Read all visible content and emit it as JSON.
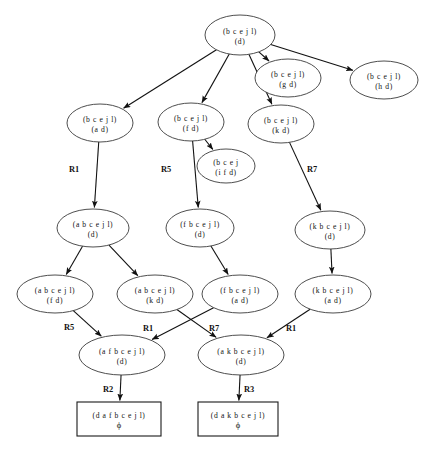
{
  "diagram": {
    "background_color": "#ffffff",
    "node_stroke_color": "#3a3a3a",
    "edge_color": "#111111",
    "box_stroke_color": "#1a1a1a",
    "nodes": [
      {
        "id": "n_root",
        "line1": "(b c e j l)",
        "line2": "(d)",
        "shape": "ellipse",
        "cx": 240,
        "cy": 35,
        "rx": 35,
        "ry": 20
      },
      {
        "id": "n_gd",
        "line1": "(b c e j l)",
        "line2": "(g d)",
        "shape": "ellipse",
        "cx": 288,
        "cy": 78,
        "rx": 33,
        "ry": 19
      },
      {
        "id": "n_hd",
        "line1": "(b c e j l)",
        "line2": "(h d)",
        "shape": "ellipse",
        "cx": 384,
        "cy": 80,
        "rx": 34,
        "ry": 19
      },
      {
        "id": "n_ad",
        "line1": "(b c e j l)",
        "line2": "(a d)",
        "shape": "ellipse",
        "cx": 100,
        "cy": 123,
        "rx": 33,
        "ry": 19
      },
      {
        "id": "n_fd",
        "line1": "(b c e j l)",
        "line2": "(f d)",
        "shape": "ellipse",
        "cx": 191,
        "cy": 122,
        "rx": 33,
        "ry": 19
      },
      {
        "id": "n_kd",
        "line1": "(b c e j l)",
        "line2": "(k d)",
        "shape": "ellipse",
        "cx": 281,
        "cy": 124,
        "rx": 33,
        "ry": 19
      },
      {
        "id": "n_ifd",
        "line1": "(b c e j",
        "line2": "(i f d)",
        "shape": "ellipse",
        "cx": 226,
        "cy": 166,
        "rx": 29,
        "ry": 17
      },
      {
        "id": "n_abcejl",
        "line1": "(a b c e j l)",
        "line2": "(d)",
        "shape": "ellipse",
        "cx": 93,
        "cy": 228,
        "rx": 36,
        "ry": 19
      },
      {
        "id": "n_fbcejl",
        "line1": "(f b c e j l)",
        "line2": "(d)",
        "shape": "ellipse",
        "cx": 200,
        "cy": 228,
        "rx": 34,
        "ry": 19
      },
      {
        "id": "n_kbcejl",
        "line1": "(k b c e j l)",
        "line2": "(d)",
        "shape": "ellipse",
        "cx": 330,
        "cy": 230,
        "rx": 35,
        "ry": 19
      },
      {
        "id": "n_abc_fd",
        "line1": "(a b c e j l)",
        "line2": "(f d)",
        "shape": "ellipse",
        "cx": 55,
        "cy": 294,
        "rx": 38,
        "ry": 19
      },
      {
        "id": "n_abc_kd",
        "line1": "(a b c e j l)",
        "line2": "(k d)",
        "shape": "ellipse",
        "cx": 155,
        "cy": 294,
        "rx": 38,
        "ry": 19
      },
      {
        "id": "n_fbc_ad",
        "line1": "(f b c e j l)",
        "line2": "(a d)",
        "shape": "ellipse",
        "cx": 240,
        "cy": 294,
        "rx": 38,
        "ry": 19
      },
      {
        "id": "n_kbc_ad",
        "line1": "(k b c e j l)",
        "line2": "(a d)",
        "shape": "ellipse",
        "cx": 333,
        "cy": 294,
        "rx": 38,
        "ry": 19
      },
      {
        "id": "n_afb",
        "line1": "(a f b c e j l)",
        "line2": "(d)",
        "shape": "ellipse",
        "cx": 122,
        "cy": 355,
        "rx": 43,
        "ry": 20
      },
      {
        "id": "n_akb",
        "line1": "(a k b c e j l)",
        "line2": "(d)",
        "shape": "ellipse",
        "cx": 241,
        "cy": 355,
        "rx": 43,
        "ry": 20
      },
      {
        "id": "n_box_l",
        "line1": "(d a f b c e j l)",
        "line2": "ϕ",
        "shape": "box",
        "cx": 119,
        "cy": 419,
        "rx": 42,
        "ry": 17
      },
      {
        "id": "n_box_r",
        "line1": "(d a k b c e j l)",
        "line2": "ϕ",
        "shape": "box",
        "cx": 238,
        "cy": 419,
        "rx": 40,
        "ry": 17
      }
    ],
    "edges": [
      {
        "from": "n_root",
        "to": "n_ad",
        "label": ""
      },
      {
        "from": "n_root",
        "to": "n_fd",
        "label": ""
      },
      {
        "from": "n_root",
        "to": "n_kd",
        "label": ""
      },
      {
        "from": "n_root",
        "to": "n_gd",
        "label": ""
      },
      {
        "from": "n_root",
        "to": "n_hd",
        "label": ""
      },
      {
        "from": "n_fd",
        "to": "n_ifd",
        "label": ""
      },
      {
        "from": "n_ad",
        "to": "n_abcejl",
        "label": "R1"
      },
      {
        "from": "n_fd",
        "to": "n_fbcejl",
        "label": "R5"
      },
      {
        "from": "n_kd",
        "to": "n_kbcejl",
        "label": "R7"
      },
      {
        "from": "n_abcejl",
        "to": "n_abc_fd",
        "label": ""
      },
      {
        "from": "n_abcejl",
        "to": "n_abc_kd",
        "label": ""
      },
      {
        "from": "n_fbcejl",
        "to": "n_fbc_ad",
        "label": ""
      },
      {
        "from": "n_kbcejl",
        "to": "n_kbc_ad",
        "label": ""
      },
      {
        "from": "n_abc_fd",
        "to": "n_afb",
        "label": "R5"
      },
      {
        "from": "n_abc_kd",
        "to": "n_akb",
        "label": "R1"
      },
      {
        "from": "n_fbc_ad",
        "to": "n_afb",
        "label": "R7"
      },
      {
        "from": "n_kbc_ad",
        "to": "n_akb",
        "label": "R1"
      },
      {
        "from": "n_afb",
        "to": "n_box_l",
        "label": "R2"
      },
      {
        "from": "n_akb",
        "to": "n_box_r",
        "label": "R3"
      }
    ],
    "edge_labels": [
      {
        "text": "R1",
        "x": 74,
        "y": 172
      },
      {
        "text": "R5",
        "x": 166,
        "y": 172
      },
      {
        "text": "R7",
        "x": 312,
        "y": 172
      },
      {
        "text": "R5",
        "x": 69,
        "y": 330
      },
      {
        "text": "R1",
        "x": 148,
        "y": 331
      },
      {
        "text": "R7",
        "x": 214,
        "y": 331
      },
      {
        "text": "R1",
        "x": 291,
        "y": 331
      },
      {
        "text": "R2",
        "x": 108,
        "y": 392
      },
      {
        "text": "R3",
        "x": 249,
        "y": 392
      }
    ]
  }
}
